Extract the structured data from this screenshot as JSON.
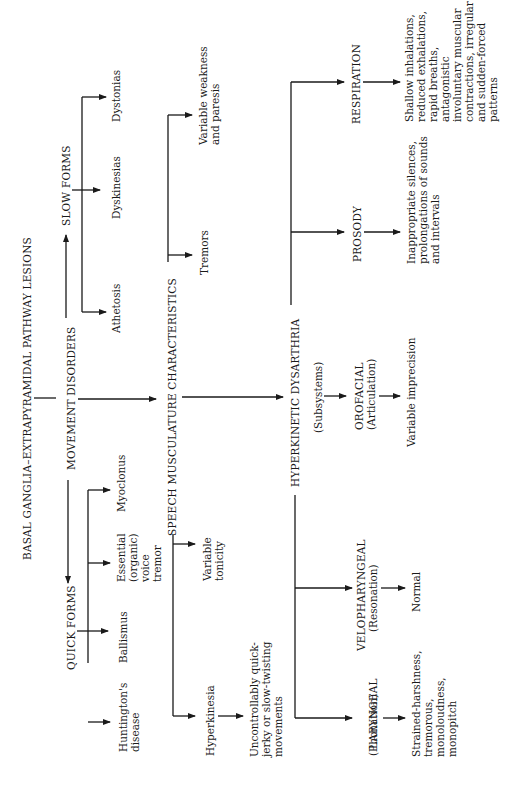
{
  "title": "BASAL GANGLIA–EXTRAPYRAMIDAL PATHWAY LESIONS",
  "movement_disorders": "MOVEMENT DISORDERS",
  "quick_forms": {
    "label": "QUICK FORMS",
    "items": [
      "Huntington's\ndisease",
      "Ballismus",
      "Essential\n(organic)\nvoice\ntremor",
      "Myoclonus"
    ]
  },
  "slow_forms": {
    "label": "SLOW FORMS",
    "items": [
      "Athetosis",
      "Dyskinesias",
      "Dystonias"
    ]
  },
  "speech": {
    "label": "SPEECH MUSCULATURE CHARACTERISTICS",
    "items": [
      "Hyperkinesia",
      "Variable\ntonicity",
      "Tremors",
      "Variable weakness\nand paresis"
    ],
    "hyperkinesia_detail": "Uncontrollably quick-\njerky or slow-twisting\nmovements"
  },
  "dysarthria": {
    "label": "HYPERKINETIC DYSARTHRIA",
    "subsystems_label": "(Subsystems)",
    "subsystems": [
      {
        "name": "LARYNGEAL",
        "sub": "(Phonation)",
        "detail": "Strained-harshness,\ntremorous,\nmonoloudness,\nmonopitch"
      },
      {
        "name": "VELOPHARYNGEAL",
        "sub": "(Resonation)",
        "detail": "Normal"
      },
      {
        "name": "OROFACIAL",
        "sub": "(Articulation)",
        "detail": "Variable imprecision"
      },
      {
        "name": "PROSODY",
        "sub": "",
        "detail": "Inappropriate silences,\nprolongations of sounds\nand intervals"
      },
      {
        "name": "RESPIRATION",
        "sub": "",
        "detail": "Shallow inhalations,\nreduced exhalations,\nrapid breaths,\nantagonistic\ninvoluntary muscular\ncontractions, irregular\nand sudden-forced\npatterns"
      }
    ]
  }
}
